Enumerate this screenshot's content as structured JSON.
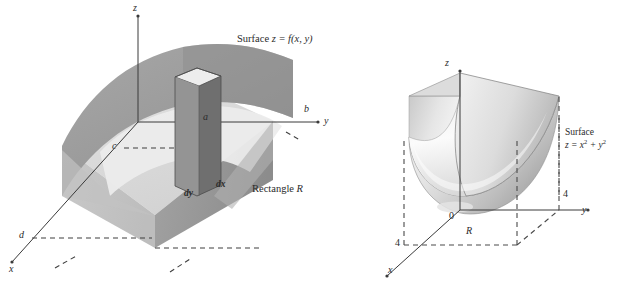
{
  "figure": {
    "kind": "double-diagram",
    "background": "#ffffff",
    "ink": "#2b2b2b",
    "palette": {
      "surface_top": "#9b9b9b",
      "surface_top_light": "#b4b4b4",
      "surface_side": "#c6c6c6",
      "surface_side_dark": "#8e8e8e",
      "base_floor": "#d8d8d8",
      "column_front": "#8a8a8a",
      "column_side": "#6f6f6f",
      "column_top": "#e8e8e8",
      "bowl_light": "#f4f4f4",
      "bowl_mid": "#d0d0d0",
      "bowl_dark": "#a9a9a9",
      "dash": "#4a4a4a"
    }
  },
  "left_panel": {
    "name": "surface-over-rectangle",
    "annotations": {
      "surface_caption": "Surface z = f(x, y)",
      "region_caption": "Rectangle R",
      "axis_z": "z",
      "axis_y": "y",
      "axis_x": "x",
      "bound_a": "a",
      "bound_b": "b",
      "bound_c": "c",
      "bound_d": "d",
      "element_dy": "dy",
      "element_dx": "dx"
    }
  },
  "right_panel": {
    "name": "paraboloid-over-square",
    "annotations": {
      "surface_caption_line1": "Surface",
      "surface_caption_line2_pre": "z = x",
      "surface_caption_line2_exp1": "2",
      "surface_caption_line2_mid": " + y",
      "surface_caption_line2_exp2": "2",
      "axis_z": "z",
      "axis_y": "y",
      "axis_x": "x",
      "origin": "0",
      "tick_y": "4",
      "tick_x": "4",
      "region_label": "R"
    }
  },
  "chart_data": {
    "type": "diagram",
    "panels": [
      {
        "id": "left",
        "type": "surface-over-rectangle",
        "surface_equation": "z = f(x, y)",
        "region": "Rectangle R",
        "region_bounds": {
          "y_from": "c",
          "y_to": "b",
          "x_label": "d",
          "corner": "a"
        },
        "differential_element": {
          "width": "dy",
          "depth": "dx",
          "shape": "rectangular column"
        },
        "axes": [
          "x",
          "y",
          "z"
        ]
      },
      {
        "id": "right",
        "type": "paraboloid-over-square",
        "surface_equation": "z = x^2 + y^2",
        "region": "R",
        "region_extent": {
          "x": [
            0,
            4
          ],
          "y": [
            0,
            4
          ]
        },
        "tick_labels": {
          "x": "4",
          "y": "4",
          "origin": "0"
        },
        "axes": [
          "x",
          "y",
          "z"
        ]
      }
    ]
  }
}
